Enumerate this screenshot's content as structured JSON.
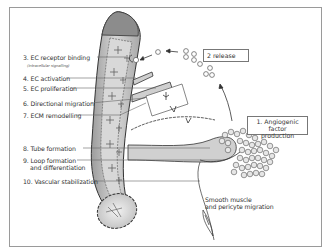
{
  "diagram": {
    "type": "angiogenesis-process-illustration",
    "steps": [
      {
        "number": "1",
        "label": "1. Angiogenic factor",
        "label_line2": "production"
      },
      {
        "number": "2",
        "label": "2 release"
      },
      {
        "number": "3",
        "label": "3. EC receptor binding",
        "sublabel": "(intracellular signalling)"
      },
      {
        "number": "4",
        "label": "4. EC activation"
      },
      {
        "number": "5",
        "label": "5. EC proliferation"
      },
      {
        "number": "6",
        "label": "6. Directional migration"
      },
      {
        "number": "7",
        "label": "7. ECM remodelling"
      },
      {
        "number": "8",
        "label": "8. Tube formation"
      },
      {
        "number": "9",
        "label": "9. Loop formation",
        "label_line2": "and differentiation"
      },
      {
        "number": "10",
        "label": "10. Vascular stabilization"
      }
    ],
    "annotations": {
      "smooth_muscle": "Smooth muscle",
      "smooth_muscle_line2": "and pericyte migration"
    },
    "colors": {
      "vessel_fill": "#bdbdbd",
      "vessel_light": "#e2e2e2",
      "outline": "#333333",
      "leader_line": "#555555",
      "frame": "#9a9a9a"
    }
  }
}
